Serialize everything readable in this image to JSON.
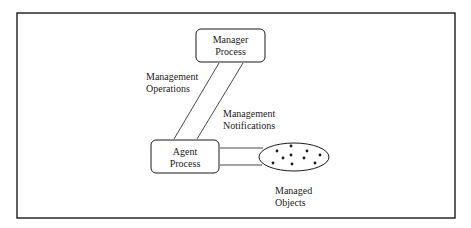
{
  "diagram": {
    "nodes": {
      "manager": {
        "line1": "Manager",
        "line2": "Process"
      },
      "agent": {
        "line1": "Agent",
        "line2": "Process"
      },
      "managed_objects": {
        "line1": "Managed",
        "line2": "Objects",
        "object_count": 10
      }
    },
    "edges": {
      "operations": {
        "line1": "Management",
        "line2": "Operations"
      },
      "notifications": {
        "line1": "Management",
        "line2": "Notifications"
      }
    },
    "colors": {
      "stroke": "#1a1a1a",
      "background": "#ffffff"
    }
  }
}
